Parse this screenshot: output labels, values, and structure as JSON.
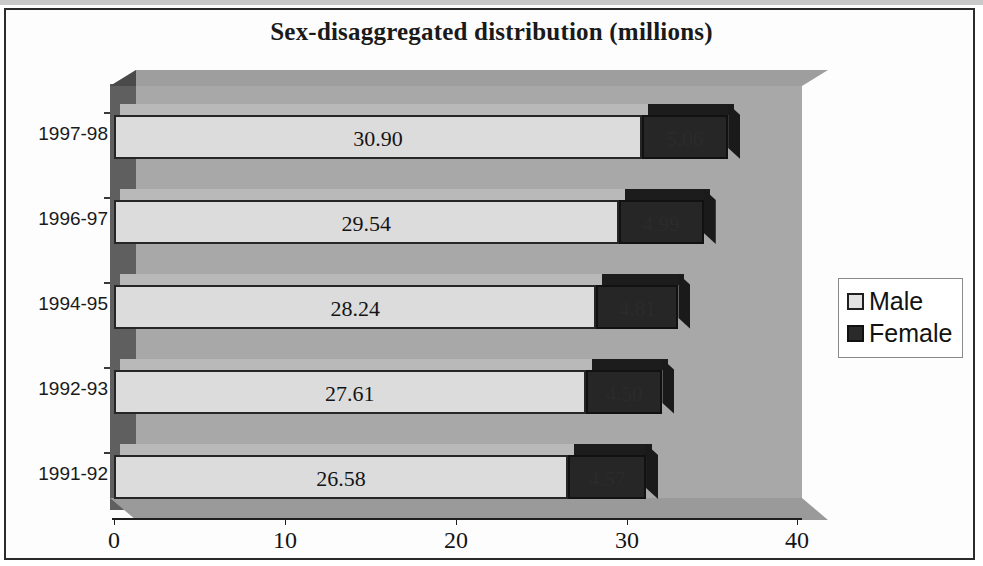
{
  "chart_data": {
    "type": "bar",
    "orientation": "horizontal",
    "stacked": true,
    "title": "Sex-disaggregated distribution (millions)",
    "xlabel": "",
    "ylabel": "",
    "xlim": [
      0,
      40
    ],
    "x_ticks": [
      "0",
      "10",
      "20",
      "30",
      "40"
    ],
    "x_tick_values": [
      0,
      10,
      20,
      30,
      40
    ],
    "grid": false,
    "legend_position": "right",
    "categories": [
      "1997-98",
      "1996-97",
      "1994-95",
      "1992-93",
      "1991-92"
    ],
    "category_order_top_to_bottom": [
      "1997-98",
      "1996-97",
      "1994-95",
      "1992-93",
      "1991-92"
    ],
    "series": [
      {
        "name": "Male",
        "values": [
          30.9,
          29.54,
          28.24,
          27.61,
          26.58
        ],
        "labels": [
          "30.90",
          "29.54",
          "28.24",
          "27.61",
          "26.58"
        ],
        "color": "#dcdcdc"
      },
      {
        "name": "Female",
        "values": [
          5.06,
          4.99,
          4.81,
          4.5,
          4.57
        ],
        "labels": [
          "5.06",
          "4.99",
          "4.81",
          "4.50",
          "4.57"
        ],
        "labels_legible": false,
        "color": "#262626"
      }
    ]
  },
  "legend": {
    "items": [
      {
        "label": "Male",
        "swatch": "light-square-swatch"
      },
      {
        "label": "Female",
        "swatch": "dark-square-swatch"
      }
    ]
  }
}
